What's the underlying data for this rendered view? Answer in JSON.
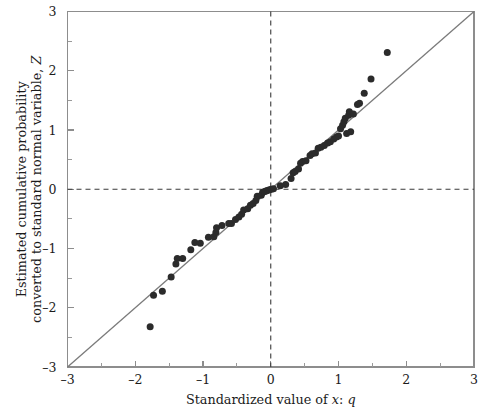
{
  "chart_data": {
    "type": "scatter",
    "title": "",
    "subtitle": "",
    "xlabel": "Standardized value of x: q",
    "xlabel_parts": [
      {
        "text": "Standardized value of ",
        "italic": false
      },
      {
        "text": "x",
        "italic": true
      },
      {
        "text": ": ",
        "italic": false
      },
      {
        "text": "q",
        "italic": true
      }
    ],
    "ylabel": "Estimated cumulative probability converted to standard normal variable, Z",
    "ylabel_line1": "Estimated cumulative probability",
    "ylabel_line2": "converted to standard normal variable, Z",
    "xlim": [
      -3,
      3
    ],
    "ylim": [
      -3,
      3
    ],
    "xticks": [
      -3,
      -2,
      -1,
      0,
      1,
      2,
      3
    ],
    "yticks": [
      -3,
      -2,
      -1,
      0,
      1,
      2,
      3
    ],
    "xticklabels": [
      "-3",
      "-2",
      "-1",
      "0",
      "1",
      "2",
      "3"
    ],
    "yticklabels": [
      "-3",
      "-2",
      "-1",
      "0",
      "1",
      "2",
      "3"
    ],
    "minor_tick_step": 0.5,
    "grid": false,
    "legend": null,
    "legend_position": "none",
    "annotations": [],
    "reference_line": {
      "name": "identity line y = x",
      "x_start": -3,
      "y_start": -3,
      "x_end": 3,
      "y_end": 3,
      "color": "#7b7b7b",
      "style": "solid"
    },
    "zero_lines": {
      "horizontal_y": 0,
      "vertical_x": 0,
      "color": "#3a3a3a",
      "style": "dashed"
    },
    "series": [
      {
        "name": "Sample quantiles",
        "marker": "filled-circle",
        "color": "#2b2b2b",
        "marker_size": 7,
        "points": [
          [
            -1.78,
            -2.32
          ],
          [
            -1.73,
            -1.79
          ],
          [
            -1.6,
            -1.72
          ],
          [
            -1.47,
            -1.48
          ],
          [
            -1.4,
            -1.26
          ],
          [
            -1.38,
            -1.17
          ],
          [
            -1.3,
            -1.17
          ],
          [
            -1.18,
            -1.02
          ],
          [
            -1.12,
            -0.9
          ],
          [
            -1.04,
            -0.91
          ],
          [
            -0.92,
            -0.81
          ],
          [
            -0.84,
            -0.8
          ],
          [
            -0.81,
            -0.73
          ],
          [
            -0.8,
            -0.65
          ],
          [
            -0.72,
            -0.61
          ],
          [
            -0.62,
            -0.58
          ],
          [
            -0.58,
            -0.58
          ],
          [
            -0.52,
            -0.51
          ],
          [
            -0.47,
            -0.47
          ],
          [
            -0.43,
            -0.42
          ],
          [
            -0.4,
            -0.35
          ],
          [
            -0.34,
            -0.33
          ],
          [
            -0.3,
            -0.27
          ],
          [
            -0.26,
            -0.24
          ],
          [
            -0.22,
            -0.19
          ],
          [
            -0.2,
            -0.12
          ],
          [
            -0.14,
            -0.1
          ],
          [
            -0.12,
            -0.05
          ],
          [
            -0.09,
            -0.04
          ],
          [
            -0.07,
            -0.03
          ],
          [
            -0.05,
            -0.02
          ],
          [
            -0.02,
            -0.01
          ],
          [
            0.01,
            0.0
          ],
          [
            0.04,
            0.01
          ],
          [
            0.14,
            0.06
          ],
          [
            0.22,
            0.08
          ],
          [
            0.3,
            0.18
          ],
          [
            0.33,
            0.28
          ],
          [
            0.36,
            0.3
          ],
          [
            0.41,
            0.34
          ],
          [
            0.44,
            0.44
          ],
          [
            0.47,
            0.47
          ],
          [
            0.52,
            0.48
          ],
          [
            0.58,
            0.57
          ],
          [
            0.61,
            0.6
          ],
          [
            0.66,
            0.61
          ],
          [
            0.7,
            0.69
          ],
          [
            0.74,
            0.71
          ],
          [
            0.79,
            0.74
          ],
          [
            0.84,
            0.78
          ],
          [
            0.88,
            0.8
          ],
          [
            0.93,
            0.85
          ],
          [
            0.97,
            0.88
          ],
          [
            1.0,
            0.9
          ],
          [
            1.03,
            1.02
          ],
          [
            1.06,
            1.08
          ],
          [
            1.08,
            1.14
          ],
          [
            1.1,
            1.2
          ],
          [
            1.15,
            1.25
          ],
          [
            1.16,
            1.31
          ],
          [
            1.12,
            0.94
          ],
          [
            1.18,
            0.97
          ],
          [
            1.22,
            1.27
          ],
          [
            1.28,
            1.43
          ],
          [
            1.31,
            1.45
          ],
          [
            1.38,
            1.62
          ],
          [
            1.48,
            1.86
          ],
          [
            1.72,
            2.31
          ]
        ]
      }
    ]
  }
}
